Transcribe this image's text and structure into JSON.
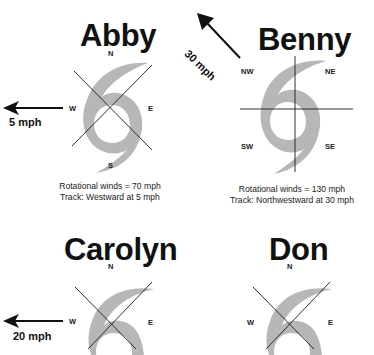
{
  "clipped_top_text": "p                                g",
  "colors": {
    "hurricane_fill": "#b7b7b7",
    "line": "#1a1a1a",
    "text": "#111111"
  },
  "storms": [
    {
      "name": "Abby",
      "compass_type": "diagonal",
      "labels": {
        "n": "N",
        "s": "S",
        "e": "E",
        "w": "W"
      },
      "rotational_winds": "Rotational winds = 70 mph",
      "track": "Track: Westward at 5 mph",
      "arrow": {
        "direction": "west",
        "label": "5 mph"
      }
    },
    {
      "name": "Benny",
      "compass_type": "orthogonal",
      "labels": {
        "nw": "NW",
        "ne": "NE",
        "sw": "SW",
        "se": "SE"
      },
      "rotational_winds": "Rotational winds = 130 mph",
      "track": "Track: Northwestward at 30 mph",
      "arrow": {
        "direction": "northwest",
        "label": "30 mph"
      }
    },
    {
      "name": "Carolyn",
      "compass_type": "diagonal",
      "labels": {
        "n": "N",
        "e": "E",
        "w": "W"
      },
      "arrow": {
        "direction": "west",
        "label": "20 mph"
      }
    },
    {
      "name": "Don",
      "compass_type": "diagonal",
      "labels": {
        "n": "N",
        "e": "E",
        "w": "W"
      }
    }
  ]
}
